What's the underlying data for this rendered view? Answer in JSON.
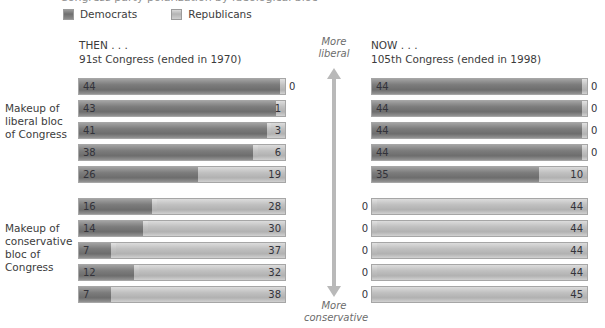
{
  "title_partial": "Congress party polarization by ideological bloc",
  "legend": {
    "items": [
      {
        "label": "Democrats",
        "icon": "dem-swatch-icon",
        "color": "#7c7c7c"
      },
      {
        "label": "Republicans",
        "icon": "rep-swatch-icon",
        "color": "#c0c0c0"
      }
    ]
  },
  "columns": {
    "then": {
      "eyebrow": "THEN . . .",
      "subtitle": "91st Congress (ended in 1970)"
    },
    "now": {
      "eyebrow": "NOW . . .",
      "subtitle": "105th Congress (ended in 1998)"
    }
  },
  "row_groups": {
    "liberal": "Makeup of liberal bloc of Congress",
    "conservative": "Makeup of conservative bloc of Congress"
  },
  "axis": {
    "top_caption_line1": "More",
    "top_caption_line2": "liberal",
    "bottom_caption_line1": "More",
    "bottom_caption_line2": "conservative"
  },
  "chart_data": {
    "type": "bar",
    "orientation": "horizontal",
    "stacked": true,
    "title": "Congress party polarization by ideological bloc",
    "xlabel": "",
    "ylabel": "",
    "xlim": [
      0,
      45
    ],
    "grid": false,
    "legend_position": "top-left",
    "series": [
      {
        "name": "Democrats",
        "color": "#7c7c7c"
      },
      {
        "name": "Republicans",
        "color": "#c0c0c0"
      }
    ],
    "panels": [
      {
        "id": "then-liberal",
        "column": "THEN . . .",
        "column_subtitle": "91st Congress (ended in 1970)",
        "group": "Makeup of liberal bloc of Congress",
        "total": 45,
        "rows": [
          {
            "democrats": 44,
            "republicans": 0
          },
          {
            "democrats": 43,
            "republicans": 1
          },
          {
            "democrats": 41,
            "republicans": 3
          },
          {
            "democrats": 38,
            "republicans": 6
          },
          {
            "democrats": 26,
            "republicans": 19
          }
        ]
      },
      {
        "id": "now-liberal",
        "column": "NOW . . .",
        "column_subtitle": "105th Congress (ended in 1998)",
        "group": "Makeup of liberal bloc of Congress",
        "total": 45,
        "rows": [
          {
            "democrats": 44,
            "republicans": 0
          },
          {
            "democrats": 44,
            "republicans": 0
          },
          {
            "democrats": 44,
            "republicans": 0
          },
          {
            "democrats": 44,
            "republicans": 0
          },
          {
            "democrats": 35,
            "republicans": 10
          }
        ]
      },
      {
        "id": "then-conservative",
        "column": "THEN . . .",
        "column_subtitle": "91st Congress (ended in 1970)",
        "group": "Makeup of conservative bloc of Congress",
        "total": 45,
        "rows": [
          {
            "democrats": 16,
            "republicans": 28
          },
          {
            "democrats": 14,
            "republicans": 30
          },
          {
            "democrats": 7,
            "republicans": 37
          },
          {
            "democrats": 12,
            "republicans": 32
          },
          {
            "democrats": 7,
            "republicans": 38
          }
        ]
      },
      {
        "id": "now-conservative",
        "column": "NOW . . .",
        "column_subtitle": "105th Congress (ended in 1998)",
        "group": "Makeup of conservative bloc of Congress",
        "total": 45,
        "rows": [
          {
            "democrats": 0,
            "republicans": 44
          },
          {
            "democrats": 0,
            "republicans": 44
          },
          {
            "democrats": 0,
            "republicans": 44
          },
          {
            "democrats": 0,
            "republicans": 44
          },
          {
            "democrats": 0,
            "republicans": 45
          }
        ]
      }
    ]
  }
}
